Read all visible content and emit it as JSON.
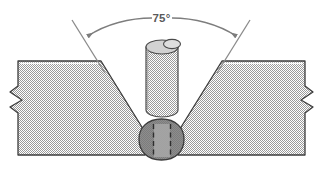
{
  "figure": {
    "type": "technical-drawing",
    "background_color": "#ffffff"
  },
  "dimension": {
    "angle_label": "75°",
    "angle_value": 75,
    "unit": "degrees",
    "leader_color": "#7d7d7d",
    "label_color": "#5a5a5a",
    "arrow_style": "curved-arc-double-arrow"
  },
  "parts": {
    "left_plate": {
      "name": "Left base metal plate",
      "fill_color": "#c8c8c8",
      "outline_color": "#3c3c3c",
      "hatch": "fine-dither",
      "break_symbol": "zigzag"
    },
    "right_plate": {
      "name": "Right base metal plate",
      "fill_color": "#c8c8c8",
      "outline_color": "#3c3c3c",
      "hatch": "fine-dither",
      "break_symbol": "zigzag"
    },
    "electrode": {
      "name": "Covered electrode",
      "fill_color": "#c8c8c8",
      "outline_color": "#4a4a4a",
      "core_wire_fill": "#d8d8d8",
      "shape": "cylinder-with-elliptical-top"
    },
    "weld_bead": {
      "name": "Weld bead root pass",
      "fill_color": "#8e8e8e",
      "inner_band_color": "#a6a6a6",
      "outline_color": "#3c3c3c",
      "dashed_pass_lines": 2
    }
  }
}
